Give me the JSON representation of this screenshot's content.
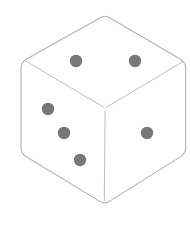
{
  "canvas": {
    "width": 190,
    "height": 252,
    "background_color": "#ffffff"
  },
  "illustration": {
    "title": "Six-sided die",
    "subject": "dice",
    "style": "isometric line drawing",
    "outline_color": "#b2b2b2",
    "inner_edge_color": "#bdbdbd",
    "face_fill_color": "#ffffff",
    "pip_color": "#787878",
    "outline_width": 1.1,
    "inner_edge_width": 1.0,
    "pip_radius": 6.2
  },
  "geometry": {
    "top_apex": {
      "x": 105,
      "y": 17
    },
    "left_shoulder": {
      "x": 21,
      "y": 66
    },
    "right_shoulder": {
      "x": 185,
      "y": 66
    },
    "left_base": {
      "x": 21,
      "y": 155
    },
    "right_base": {
      "x": 185,
      "y": 155
    },
    "bottom_vertex": {
      "x": 104,
      "y": 203
    },
    "center_junction": {
      "x": 105,
      "y": 108
    },
    "corner_radius": 13
  },
  "faces": [
    {
      "name": "top-face",
      "label": "Top face",
      "value": 2,
      "pips": [
        {
          "cx": 76,
          "cy": 61
        },
        {
          "cx": 135,
          "cy": 61
        }
      ]
    },
    {
      "name": "left-face",
      "label": "Left face",
      "value": 3,
      "pips": [
        {
          "cx": 48,
          "cy": 109
        },
        {
          "cx": 64,
          "cy": 133
        },
        {
          "cx": 80,
          "cy": 160
        }
      ]
    },
    {
      "name": "right-face",
      "label": "Right face",
      "value": 1,
      "pips": [
        {
          "cx": 147,
          "cy": 133
        }
      ]
    }
  ],
  "visible_total": 6
}
